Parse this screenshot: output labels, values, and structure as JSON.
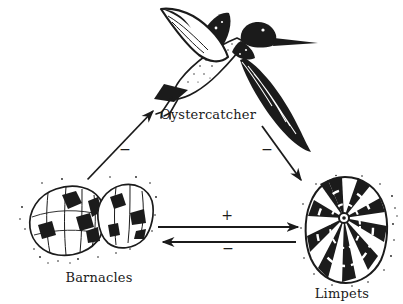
{
  "figure": {
    "type": "interaction-diagram",
    "background": "#ffffff",
    "ink": "#1b1b1b",
    "nodes": {
      "oystercatcher": {
        "label": "Oystercatcher",
        "illustration": "oystercatcher-drawing"
      },
      "barnacles": {
        "label": "Barnacles",
        "illustration": "barnacles-drawing"
      },
      "limpets": {
        "label": "Limpets",
        "illustration": "limpet-drawing"
      }
    },
    "edges": [
      {
        "from": "Barnacles",
        "to": "Oystercatcher",
        "sign": "−"
      },
      {
        "from": "Oystercatcher",
        "to": "Limpets",
        "sign": "−"
      },
      {
        "from": "Barnacles",
        "to": "Limpets",
        "sign": "+"
      },
      {
        "from": "Limpets",
        "to": "Barnacles",
        "sign": "−"
      }
    ]
  }
}
